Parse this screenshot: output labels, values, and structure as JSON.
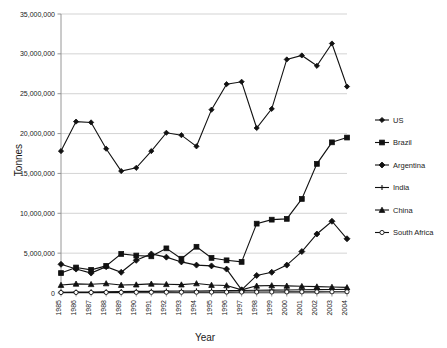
{
  "chart_data": {
    "type": "line",
    "title": "",
    "xlabel": "Year",
    "ylabel": "Tonnes",
    "grid": true,
    "legend_position": "right",
    "ylim": [
      0,
      35000000
    ],
    "ytick_labels": [
      "35,000,000",
      "30,000,000",
      "25,000,000",
      "20,000,000",
      "15,000,000",
      "10,000,000",
      "5,000,000",
      "0"
    ],
    "ytick_values": [
      35000000,
      30000000,
      25000000,
      20000000,
      15000000,
      10000000,
      5000000,
      0
    ],
    "categories": [
      "1985",
      "1986",
      "1987",
      "1988",
      "1989",
      "1990",
      "1991",
      "1992",
      "1993",
      "1994",
      "1995",
      "1996",
      "1997",
      "1998",
      "1999",
      "2000",
      "2001",
      "2002",
      "2003",
      "2004"
    ],
    "series": [
      {
        "name": "US",
        "marker": "diamond",
        "values": [
          17800000,
          21500000,
          21400000,
          18100000,
          15300000,
          15700000,
          17800000,
          20100000,
          19800000,
          18400000,
          23000000,
          26200000,
          26500000,
          20700000,
          23100000,
          29300000,
          29800000,
          28500000,
          31300000,
          25900000
        ]
      },
      {
        "name": "Brazil",
        "marker": "square",
        "values": [
          2500000,
          3200000,
          2900000,
          3400000,
          4900000,
          4700000,
          4600000,
          5600000,
          4300000,
          5800000,
          4400000,
          4100000,
          3900000,
          8700000,
          9200000,
          9300000,
          11800000,
          16200000,
          18900000,
          19500000
        ]
      },
      {
        "name": "Argentina",
        "marker": "diamond-large",
        "values": [
          3600000,
          3000000,
          2500000,
          3300000,
          2600000,
          4100000,
          4900000,
          4500000,
          3900000,
          3500000,
          3400000,
          3000000,
          400000,
          2200000,
          2600000,
          3500000,
          5200000,
          7400000,
          9000000,
          6800000
        ]
      },
      {
        "name": "India",
        "marker": "cross",
        "values": [
          100000,
          120000,
          130000,
          150000,
          180000,
          200000,
          210000,
          230000,
          250000,
          260000,
          280000,
          300000,
          320000,
          340000,
          360000,
          380000,
          400000,
          420000,
          440000,
          450000
        ]
      },
      {
        "name": "China",
        "marker": "triangle",
        "values": [
          1000000,
          1150000,
          1100000,
          1200000,
          1000000,
          1050000,
          1150000,
          1100000,
          1050000,
          1200000,
          1000000,
          950000,
          400000,
          900000,
          950000,
          900000,
          850000,
          800000,
          750000,
          700000
        ]
      },
      {
        "name": "South Africa",
        "marker": "circle-open",
        "values": [
          60000,
          70000,
          65000,
          75000,
          80000,
          85000,
          90000,
          95000,
          100000,
          105000,
          110000,
          115000,
          120000,
          125000,
          130000,
          135000,
          140000,
          145000,
          150000,
          155000
        ]
      }
    ]
  }
}
